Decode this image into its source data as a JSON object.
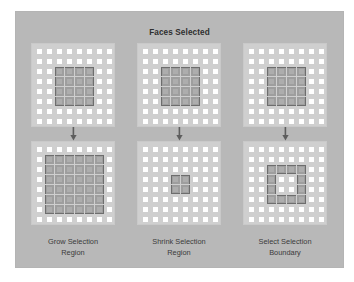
{
  "figure": {
    "title": "Faces Selected",
    "background_color": "#ffffff",
    "panel_color": "#b8b8b8",
    "grid_color": "#cfcfcf",
    "cell_face_color": "#ffffff",
    "selected_cell_color": "#9e9e9e",
    "selection_outline_color": "#6d6d6d",
    "text_color": "#2f2f2f"
  },
  "arrow": {
    "icon": "arrow-down-icon",
    "direction": "down"
  },
  "columns": [
    {
      "id": "grow-selection-region",
      "caption_line1": "Grow Selection",
      "caption_line2": "Region",
      "before": {
        "label": "initial 4x4 selection",
        "rows": 8,
        "cols": 8,
        "selected": [
          [
            2,
            2
          ],
          [
            2,
            3
          ],
          [
            2,
            4
          ],
          [
            2,
            5
          ],
          [
            3,
            2
          ],
          [
            3,
            3
          ],
          [
            3,
            4
          ],
          [
            3,
            5
          ],
          [
            4,
            2
          ],
          [
            4,
            3
          ],
          [
            4,
            4
          ],
          [
            4,
            5
          ],
          [
            5,
            2
          ],
          [
            5,
            3
          ],
          [
            5,
            4
          ],
          [
            5,
            5
          ]
        ]
      },
      "after": {
        "label": "grown 6x6 selection",
        "rows": 8,
        "cols": 8,
        "selected": [
          [
            1,
            1
          ],
          [
            1,
            2
          ],
          [
            1,
            3
          ],
          [
            1,
            4
          ],
          [
            1,
            5
          ],
          [
            1,
            6
          ],
          [
            2,
            1
          ],
          [
            2,
            2
          ],
          [
            2,
            3
          ],
          [
            2,
            4
          ],
          [
            2,
            5
          ],
          [
            2,
            6
          ],
          [
            3,
            1
          ],
          [
            3,
            2
          ],
          [
            3,
            3
          ],
          [
            3,
            4
          ],
          [
            3,
            5
          ],
          [
            3,
            6
          ],
          [
            4,
            1
          ],
          [
            4,
            2
          ],
          [
            4,
            3
          ],
          [
            4,
            4
          ],
          [
            4,
            5
          ],
          [
            4,
            6
          ],
          [
            5,
            1
          ],
          [
            5,
            2
          ],
          [
            5,
            3
          ],
          [
            5,
            4
          ],
          [
            5,
            5
          ],
          [
            5,
            6
          ],
          [
            6,
            1
          ],
          [
            6,
            2
          ],
          [
            6,
            3
          ],
          [
            6,
            4
          ],
          [
            6,
            5
          ],
          [
            6,
            6
          ]
        ]
      }
    },
    {
      "id": "shrink-selection-region",
      "caption_line1": "Shrink Selection",
      "caption_line2": "Region",
      "before": {
        "label": "initial 4x4 selection",
        "rows": 8,
        "cols": 8,
        "selected": [
          [
            2,
            2
          ],
          [
            2,
            3
          ],
          [
            2,
            4
          ],
          [
            2,
            5
          ],
          [
            3,
            2
          ],
          [
            3,
            3
          ],
          [
            3,
            4
          ],
          [
            3,
            5
          ],
          [
            4,
            2
          ],
          [
            4,
            3
          ],
          [
            4,
            4
          ],
          [
            4,
            5
          ],
          [
            5,
            2
          ],
          [
            5,
            3
          ],
          [
            5,
            4
          ],
          [
            5,
            5
          ]
        ]
      },
      "after": {
        "label": "shrunk 2x2 selection",
        "rows": 8,
        "cols": 8,
        "selected": [
          [
            3,
            3
          ],
          [
            3,
            4
          ],
          [
            4,
            3
          ],
          [
            4,
            4
          ]
        ]
      }
    },
    {
      "id": "select-selection-boundary",
      "caption_line1": "Select Selection",
      "caption_line2": "Boundary",
      "before": {
        "label": "initial 4x4 selection",
        "rows": 8,
        "cols": 8,
        "selected": [
          [
            2,
            2
          ],
          [
            2,
            3
          ],
          [
            2,
            4
          ],
          [
            2,
            5
          ],
          [
            3,
            2
          ],
          [
            3,
            3
          ],
          [
            3,
            4
          ],
          [
            3,
            5
          ],
          [
            4,
            2
          ],
          [
            4,
            3
          ],
          [
            4,
            4
          ],
          [
            4,
            5
          ],
          [
            5,
            2
          ],
          [
            5,
            3
          ],
          [
            5,
            4
          ],
          [
            5,
            5
          ]
        ]
      },
      "after": {
        "label": "boundary ring selection",
        "rows": 8,
        "cols": 8,
        "selected": [
          [
            2,
            2
          ],
          [
            2,
            3
          ],
          [
            2,
            4
          ],
          [
            2,
            5
          ],
          [
            3,
            2
          ],
          [
            3,
            5
          ],
          [
            4,
            2
          ],
          [
            4,
            5
          ],
          [
            5,
            2
          ],
          [
            5,
            3
          ],
          [
            5,
            4
          ],
          [
            5,
            5
          ]
        ]
      }
    }
  ]
}
